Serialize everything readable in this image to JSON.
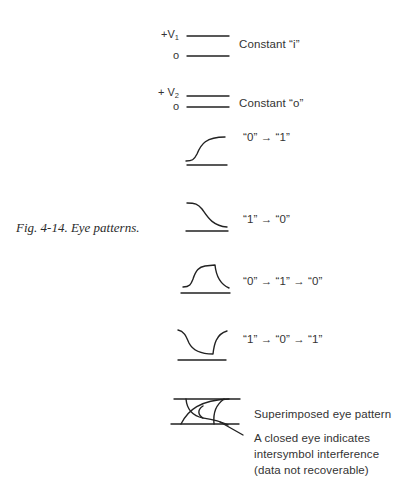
{
  "figure": {
    "caption": "Fig. 4-14. Eye patterns."
  },
  "constant_one": {
    "high_label_prefix": "+V",
    "high_label_sub": "1",
    "low_label": "o",
    "description": "Constant “i”"
  },
  "constant_zero": {
    "high_label_prefix": "+ V",
    "high_label_sub": "2",
    "low_label": "o",
    "description": "Constant “o”"
  },
  "transitions": [
    {
      "shape": "rising-edge",
      "label": "“0” → “1”"
    },
    {
      "shape": "falling-edge",
      "label": "“1” → “0”"
    },
    {
      "shape": "positive-pulse",
      "label": "“0” → “1” → “0”"
    },
    {
      "shape": "negative-pulse",
      "label": "“1” → “0” → “1”"
    }
  ],
  "eye_pattern": {
    "label": "Superimposed eye pattern",
    "note_lines": [
      "A closed eye indicates",
      "intersymbol interference",
      "(data not recoverable)"
    ]
  }
}
